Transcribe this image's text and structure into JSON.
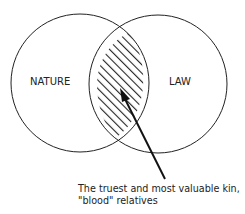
{
  "diagram": {
    "circles": [
      {
        "label": "NATURE",
        "cx": 80,
        "cy": 83,
        "r": 69
      },
      {
        "label": "LAW",
        "cx": 158,
        "cy": 84,
        "r": 69
      }
    ],
    "intersection": {
      "fill": "hatched",
      "description": "overlap of NATURE and LAW"
    },
    "annotation": {
      "line1": "The truest and most valuable kin,",
      "line2": "\"blood\" relatives"
    },
    "colors": {
      "stroke": "#222222",
      "background": "#ffffff"
    }
  }
}
